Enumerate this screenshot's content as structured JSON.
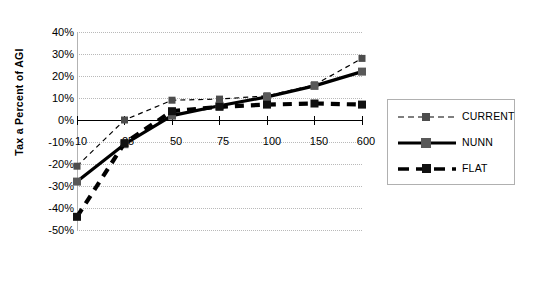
{
  "chart_data": {
    "type": "line",
    "title": "",
    "xlabel": "",
    "ylabel": "Tax a Percent of AGI",
    "categories": [
      "10",
      "25",
      "50",
      "75",
      "100",
      "150",
      "600"
    ],
    "ylim": [
      -50,
      40
    ],
    "ytick_labels": [
      "40%",
      "30%",
      "20%",
      "10%",
      "0%",
      "-10%",
      "-20%",
      "-30%",
      "-40%",
      "-50%"
    ],
    "ytick_values": [
      40,
      30,
      20,
      10,
      0,
      -10,
      -20,
      -30,
      -40,
      -50
    ],
    "grid": true,
    "legend_position": "right",
    "series": [
      {
        "name": "CURRENT",
        "style": "thin-dashed",
        "color": "#000000",
        "values": [
          -21,
          0,
          9,
          9.5,
          11,
          16,
          28
        ]
      },
      {
        "name": "NUNN",
        "style": "thick-solid",
        "color": "#000000",
        "values": [
          -28,
          -11,
          2,
          6.5,
          10.5,
          15.5,
          22
        ]
      },
      {
        "name": "FLAT",
        "style": "thick-dashed",
        "color": "#000000",
        "values": [
          -44,
          -10.5,
          4,
          6,
          7,
          7.5,
          7
        ]
      }
    ]
  },
  "legend": {
    "items": [
      {
        "label": "CURRENT"
      },
      {
        "label": "NUNN"
      },
      {
        "label": "FLAT"
      }
    ]
  },
  "axis": {
    "y_title": "Tax a Percent of AGI"
  }
}
